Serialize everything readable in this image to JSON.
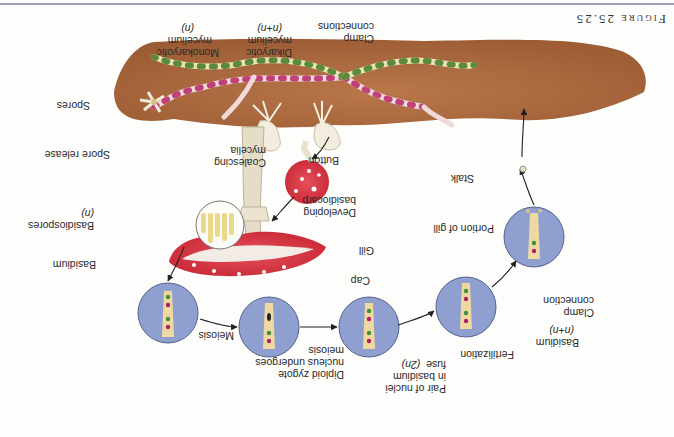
{
  "figure": {
    "title": "Figure 25.25",
    "orientation": "rotated 180 degrees"
  },
  "labels": {
    "portion_of_gill": "Portion of gill",
    "gill": "Gill",
    "cap": "Cap",
    "stalk": "Stalk",
    "developing_basidiocarp_1": "Developing",
    "developing_basidiocarp_2": "basidiocarp",
    "button": "Button",
    "coalescing_mycelia_1": "Coalescing",
    "coalescing_mycelia_2": "mycelia",
    "clamp_connections_1": "Clamp",
    "clamp_connections_2": "connections",
    "dikaryotic_1": "Dikaryotic",
    "dikaryotic_2": "mycelium",
    "dikaryotic_3": "(n+n)",
    "monokaryotic_1": "Monokaryotic",
    "monokaryotic_2": "mycelium",
    "monokaryotic_3": "(n)",
    "spores": "Spores",
    "spore_release": "Spore release",
    "basidiospores_1": "Basidiospores",
    "basidiospores_2": "(n)",
    "basidium": "Basidium",
    "meiosis": "Meiosis",
    "diploid_1": "Diploid zygote",
    "diploid_2": "nucleus undergoes",
    "diploid_3": "meiosis",
    "pair_1": "Pair of nuclei",
    "pair_2": "in basidium",
    "pair_3": "fuse",
    "pair_4": "(2n)",
    "fertilization": "Fertilization",
    "basidium_nn_1": "Basidium",
    "basidium_nn_2": "(n+n)",
    "clamp_connection_1": "Clamp",
    "clamp_connection_2": "connection"
  },
  "colors": {
    "soil": "#a8643a",
    "cap_red": "#d8323c",
    "circle_blue": "#8fa0d0",
    "hypha_tan": "#efd9a0",
    "nucleus_green": "#3f8f3f",
    "nucleus_magenta": "#b0206a"
  }
}
